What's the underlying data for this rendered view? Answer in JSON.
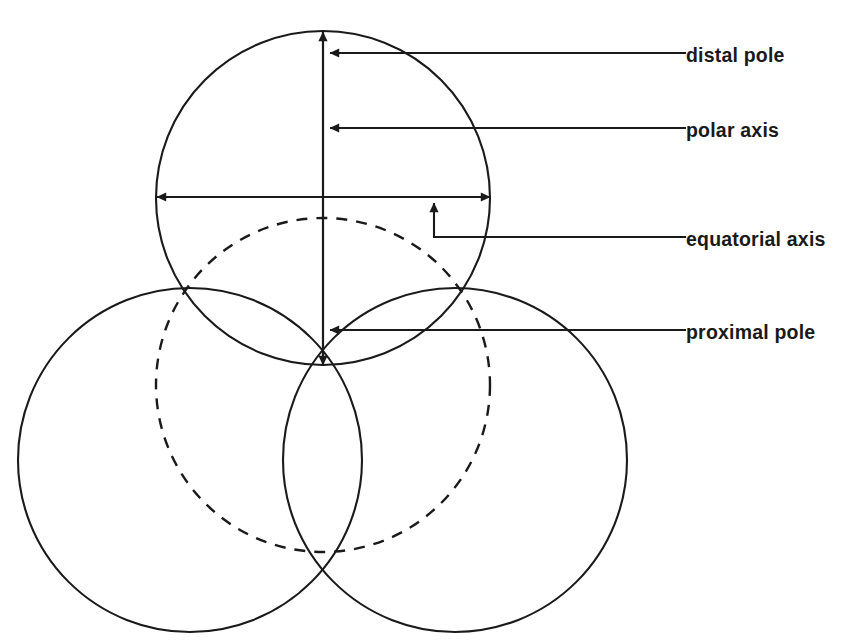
{
  "diagram": {
    "stroke_color": "#1a1a1a",
    "dashed_color": "#1a1a1a",
    "background": "#ffffff",
    "labels": [
      {
        "id": "distal-pole",
        "text": "distal pole",
        "text_x": 686,
        "text_y": 62,
        "leader_x_end": 686,
        "leader_y": 53,
        "arrow_x": 330
      },
      {
        "id": "polar-axis",
        "text": "polar axis",
        "text_x": 686,
        "text_y": 137,
        "leader_x_end": 686,
        "leader_y": 128,
        "arrow_x": 330
      },
      {
        "id": "equatorial-axis",
        "text": "equatorial axis",
        "text_x": 686,
        "text_y": 246,
        "leader_x_end": 686,
        "leader_y": 237,
        "arrow_x": 434
      },
      {
        "id": "proximal-pole",
        "text": "proximal pole",
        "text_x": 686,
        "text_y": 339,
        "leader_x_end": 686,
        "leader_y": 330,
        "arrow_x": 330
      }
    ],
    "circles": [
      {
        "id": "distal-face-circle",
        "cx": 323,
        "cy": 198,
        "r": 167,
        "style": "solid"
      },
      {
        "id": "proximal-face-circle",
        "cx": 323,
        "cy": 385,
        "r": 167,
        "style": "dashed"
      },
      {
        "id": "lower-left-lobe-circle",
        "cx": 190,
        "cy": 460,
        "r": 172,
        "style": "solid"
      },
      {
        "id": "lower-right-lobe-circle",
        "cx": 455,
        "cy": 460,
        "r": 172,
        "style": "solid"
      }
    ],
    "axes": {
      "polar": {
        "x": 323,
        "y_top": 32,
        "y_bottom": 365
      },
      "equatorial": {
        "y": 197,
        "x_left": 157,
        "x_right": 490
      }
    },
    "poles": {
      "distal": {
        "x": 323,
        "y": 32
      },
      "proximal": {
        "x": 323,
        "y": 365
      }
    }
  }
}
